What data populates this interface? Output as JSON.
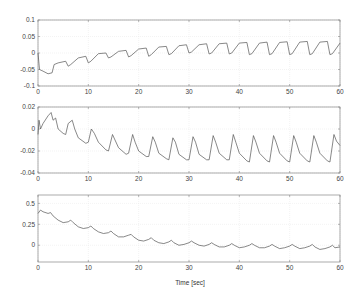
{
  "chart_data": [
    {
      "type": "line",
      "title": "",
      "xlabel": "",
      "ylabel": "",
      "xlim": [
        0,
        60
      ],
      "ylim": [
        -0.1,
        0.1
      ],
      "xticks": [
        0,
        10,
        20,
        30,
        40,
        50,
        60
      ],
      "xtick_labels": [
        "0",
        "10",
        "20",
        "30",
        "40",
        "50",
        "60"
      ],
      "yticks": [
        -0.1,
        -0.05,
        0,
        0.05,
        0.1
      ],
      "ytick_labels": [
        "-0.1",
        "-0.05",
        "0",
        "0.05",
        "0.1"
      ],
      "grid": true,
      "series": [
        {
          "name": "signal 1",
          "x": [
            0,
            0.3,
            1,
            2,
            2.8,
            3.2,
            4,
            5.5,
            6,
            6.5,
            8,
            9.5,
            10,
            10.5,
            12,
            13.5,
            14,
            14.5,
            16,
            17.5,
            18,
            18.5,
            20,
            21.5,
            22,
            22.5,
            24,
            25.5,
            26,
            26.5,
            28,
            29.5,
            30,
            30.5,
            32,
            33.5,
            34,
            34.5,
            36,
            37.5,
            38,
            38.5,
            40,
            41.5,
            42,
            42.5,
            44,
            45.5,
            46,
            46.5,
            48,
            49.5,
            50,
            50.5,
            52,
            53.5,
            54,
            54.5,
            56,
            57.5,
            58,
            58.5,
            60
          ],
          "values": [
            0.0,
            -0.05,
            -0.055,
            -0.063,
            -0.06,
            -0.035,
            -0.03,
            -0.025,
            -0.04,
            -0.035,
            -0.015,
            -0.01,
            -0.03,
            -0.025,
            -0.002,
            0.0,
            -0.015,
            -0.012,
            0.005,
            0.008,
            -0.012,
            -0.008,
            0.012,
            0.015,
            -0.01,
            -0.005,
            0.018,
            0.02,
            -0.005,
            -0.002,
            0.022,
            0.025,
            0.0,
            0.003,
            0.025,
            0.028,
            -0.003,
            0.0,
            0.028,
            0.03,
            -0.003,
            0.0,
            0.03,
            0.032,
            -0.005,
            -0.002,
            0.03,
            0.033,
            -0.005,
            -0.002,
            0.032,
            0.034,
            -0.005,
            -0.002,
            0.033,
            0.035,
            -0.005,
            -0.002,
            0.033,
            0.035,
            -0.005,
            -0.002,
            0.03
          ]
        }
      ]
    },
    {
      "type": "line",
      "title": "",
      "xlabel": "",
      "ylabel": "",
      "xlim": [
        0,
        60
      ],
      "ylim": [
        -0.04,
        0.02
      ],
      "xticks": [
        0,
        10,
        20,
        30,
        40,
        50,
        60
      ],
      "xtick_labels": [
        "0",
        "10",
        "20",
        "30",
        "40",
        "50",
        "60"
      ],
      "yticks": [
        -0.04,
        -0.02,
        0,
        0.02
      ],
      "ytick_labels": [
        "-0.04",
        "-0.02",
        "0",
        "0.02"
      ],
      "grid": true,
      "series": [
        {
          "name": "signal 2",
          "x": [
            0,
            0.2,
            0.5,
            1,
            2,
            2.6,
            3,
            3.5,
            4,
            5,
            5.5,
            6,
            6.8,
            7.3,
            8,
            9.5,
            10,
            10.6,
            11.2,
            12,
            13.5,
            14,
            14.8,
            15.3,
            16,
            17.5,
            18,
            18.8,
            19.3,
            20,
            21.5,
            22,
            22.8,
            23.3,
            24,
            25.5,
            26,
            26.8,
            27.3,
            28,
            29.5,
            30,
            30.8,
            31.3,
            32,
            33.5,
            34,
            34.8,
            35.3,
            36,
            37.5,
            38,
            38.8,
            39.3,
            40,
            41.5,
            42,
            42.8,
            43.3,
            44,
            45.5,
            46,
            46.8,
            47.3,
            48,
            49.5,
            50,
            50.8,
            51.3,
            52,
            53.5,
            54,
            54.8,
            55.3,
            56,
            57.5,
            58,
            58.8,
            59.3,
            60
          ],
          "values": [
            -0.005,
            0.008,
            0.0,
            0.005,
            0.012,
            0.015,
            0.008,
            0.01,
            0.0,
            -0.004,
            -0.005,
            0.005,
            0.008,
            0.0,
            -0.008,
            -0.013,
            -0.012,
            0.0,
            -0.004,
            -0.012,
            -0.019,
            -0.02,
            -0.005,
            -0.01,
            -0.017,
            -0.023,
            -0.022,
            -0.005,
            -0.012,
            -0.02,
            -0.025,
            -0.025,
            -0.007,
            -0.012,
            -0.022,
            -0.027,
            -0.028,
            -0.008,
            -0.012,
            -0.023,
            -0.028,
            -0.028,
            -0.007,
            -0.012,
            -0.023,
            -0.028,
            -0.028,
            -0.006,
            -0.012,
            -0.022,
            -0.028,
            -0.028,
            -0.005,
            -0.012,
            -0.022,
            -0.029,
            -0.03,
            -0.006,
            -0.012,
            -0.022,
            -0.029,
            -0.03,
            -0.006,
            -0.012,
            -0.022,
            -0.029,
            -0.03,
            -0.006,
            -0.012,
            -0.022,
            -0.029,
            -0.03,
            -0.006,
            -0.012,
            -0.022,
            -0.029,
            -0.03,
            -0.005,
            -0.011,
            -0.015
          ]
        }
      ]
    },
    {
      "type": "line",
      "title": "",
      "xlabel": "Time [sec]",
      "ylabel": "",
      "xlim": [
        0,
        60
      ],
      "ylim": [
        -0.2,
        0.6
      ],
      "xticks": [
        0,
        10,
        20,
        30,
        40,
        50,
        60
      ],
      "xtick_labels": [
        "0",
        "10",
        "20",
        "30",
        "40",
        "50",
        "60"
      ],
      "yticks": [
        0,
        0.25,
        0.5
      ],
      "ytick_labels": [
        "0",
        "0.25",
        "0.5"
      ],
      "grid": true,
      "series": [
        {
          "name": "signal 3",
          "x": [
            0,
            0.5,
            1,
            2,
            2.5,
            3,
            4,
            5,
            6,
            6.5,
            7,
            8,
            9,
            10,
            10.5,
            11,
            12,
            13,
            14,
            14.5,
            15,
            16,
            17,
            18,
            18.5,
            19,
            20,
            21,
            22,
            22.5,
            23,
            24,
            25,
            26,
            26.5,
            27,
            28,
            29,
            30,
            30.5,
            31,
            32,
            33,
            34,
            34.5,
            35,
            36,
            37,
            38,
            38.5,
            39,
            40,
            41,
            42,
            42.5,
            43,
            44,
            45,
            46,
            46.5,
            47,
            48,
            49,
            50,
            50.5,
            51,
            52,
            53,
            54,
            54.5,
            55,
            56,
            57,
            58,
            58.5,
            59,
            60
          ],
          "values": [
            0.38,
            0.42,
            0.4,
            0.38,
            0.39,
            0.35,
            0.3,
            0.27,
            0.28,
            0.3,
            0.27,
            0.22,
            0.2,
            0.21,
            0.23,
            0.2,
            0.16,
            0.14,
            0.15,
            0.17,
            0.14,
            0.1,
            0.1,
            0.12,
            0.13,
            0.1,
            0.06,
            0.05,
            0.07,
            0.09,
            0.06,
            0.03,
            0.02,
            0.04,
            0.06,
            0.03,
            0.0,
            0.01,
            0.03,
            0.05,
            0.03,
            0.0,
            -0.01,
            0.01,
            0.03,
            0.01,
            -0.02,
            -0.02,
            0.0,
            0.02,
            0.0,
            -0.03,
            -0.02,
            0.0,
            0.02,
            0.0,
            -0.03,
            -0.03,
            -0.01,
            0.01,
            -0.01,
            -0.04,
            -0.03,
            -0.01,
            0.01,
            -0.01,
            -0.04,
            -0.03,
            -0.01,
            0.01,
            -0.02,
            -0.05,
            -0.04,
            -0.02,
            0.0,
            -0.03,
            -0.02
          ]
        }
      ]
    }
  ],
  "figure": {
    "xlabel": "Time [sec]",
    "line_color": "#555555",
    "axis_color": "#888888",
    "grid_color": "#e6e6e6"
  }
}
